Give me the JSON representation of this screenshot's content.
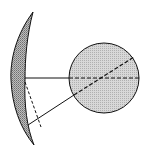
{
  "diagram": {
    "colors": {
      "background": "#ffffff",
      "stroke": "#111111",
      "crescent_fill": "#a8a8a8",
      "circle_fill": "#dcdcdc"
    },
    "elements": [
      {
        "type": "crescent",
        "label": ""
      },
      {
        "type": "circle",
        "label": ""
      },
      {
        "type": "solid-line",
        "label": "horizontal ray"
      },
      {
        "type": "dashed-line",
        "label": "horizontal ray continuation"
      },
      {
        "type": "solid-line",
        "label": "diagonal ray"
      },
      {
        "type": "dashed-line",
        "label": "diagonal ray continuation"
      },
      {
        "type": "dashed-line",
        "label": "reflected dashed ray"
      }
    ]
  }
}
